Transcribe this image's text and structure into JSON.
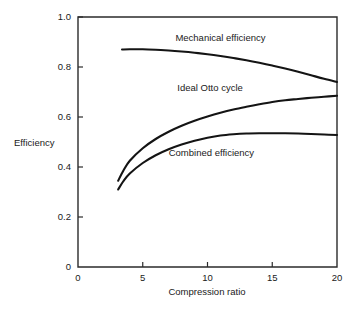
{
  "chart_data": {
    "type": "line",
    "title": "",
    "xlabel": "Compression ratio",
    "ylabel": "Efficiency",
    "xlim": [
      0,
      20
    ],
    "ylim": [
      0,
      1.0
    ],
    "xticks": [
      "0",
      "5",
      "10",
      "15",
      "20"
    ],
    "xtick_values": [
      0,
      5,
      10,
      15,
      20
    ],
    "yticks": [
      "0.2",
      "0.4",
      "0.6",
      "0.8",
      "1.0"
    ],
    "ytick_values": [
      0.2,
      0.4,
      0.6,
      0.8,
      1.0
    ],
    "grid": false,
    "legend_position": "inline-annotations",
    "series": [
      {
        "name": "Mechanical efficiency",
        "x": [
          3.4,
          4,
          5,
          6,
          7,
          8,
          9,
          10,
          11,
          12,
          13,
          14,
          15,
          16,
          17,
          18,
          19,
          20
        ],
        "values": [
          0.87,
          0.871,
          0.871,
          0.869,
          0.866,
          0.862,
          0.857,
          0.851,
          0.844,
          0.836,
          0.827,
          0.817,
          0.806,
          0.794,
          0.781,
          0.767,
          0.753,
          0.74
        ]
      },
      {
        "name": "Ideal Otto cycle",
        "x": [
          3.1,
          3.5,
          4,
          5,
          6,
          7,
          8,
          9,
          10,
          11,
          12,
          13,
          14,
          15,
          16,
          17,
          18,
          19,
          20
        ],
        "values": [
          0.345,
          0.385,
          0.425,
          0.475,
          0.512,
          0.541,
          0.565,
          0.585,
          0.602,
          0.617,
          0.63,
          0.641,
          0.651,
          0.66,
          0.667,
          0.672,
          0.677,
          0.681,
          0.685
        ]
      },
      {
        "name": "Combined efficiency",
        "x": [
          3.1,
          3.5,
          4,
          5,
          6,
          7,
          8,
          9,
          10,
          11,
          12,
          13,
          14,
          15,
          16,
          17,
          18,
          19,
          20
        ],
        "values": [
          0.31,
          0.343,
          0.374,
          0.416,
          0.447,
          0.471,
          0.49,
          0.505,
          0.517,
          0.526,
          0.531,
          0.534,
          0.535,
          0.535,
          0.535,
          0.534,
          0.532,
          0.53,
          0.528
        ]
      }
    ],
    "annotations": [
      {
        "text": "Mechanical efficiency",
        "x": 11.0,
        "y": 0.905
      },
      {
        "text": "Ideal Otto cycle",
        "x": 10.2,
        "y": 0.705
      },
      {
        "text": "Combined efficiency",
        "x": 10.3,
        "y": 0.445
      }
    ],
    "colors": {
      "curve": "#141414",
      "axis": "#2b2b2b",
      "background": "#ffffff",
      "text": "#1a1a1a"
    }
  }
}
